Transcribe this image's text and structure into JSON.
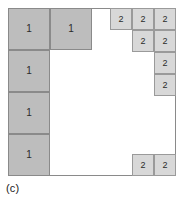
{
  "figure": {
    "caption": "(c)",
    "type": "square-packing-diagram",
    "colors": {
      "tile_1_fill": "#bdbdbd",
      "tile_2_fill": "#d8d8d8",
      "border": "#8a8a8a",
      "background": "#ffffff"
    },
    "container": {
      "x": 8,
      "y": 8,
      "width": 168,
      "height": 168
    },
    "tiles": [
      {
        "label": "1",
        "size_class": "tile-1",
        "x": 0,
        "y": 0,
        "w": 42,
        "h": 42
      },
      {
        "label": "1",
        "size_class": "tile-1",
        "x": 42,
        "y": 0,
        "w": 42,
        "h": 42
      },
      {
        "label": "1",
        "size_class": "tile-1",
        "x": 0,
        "y": 42,
        "w": 42,
        "h": 42
      },
      {
        "label": "1",
        "size_class": "tile-1",
        "x": 0,
        "y": 84,
        "w": 42,
        "h": 42
      },
      {
        "label": "1",
        "size_class": "tile-1",
        "x": 0,
        "y": 126,
        "w": 42,
        "h": 42
      },
      {
        "label": "2",
        "size_class": "tile-2",
        "x": 102,
        "y": 0,
        "w": 22,
        "h": 22
      },
      {
        "label": "2",
        "size_class": "tile-2",
        "x": 124,
        "y": 0,
        "w": 22,
        "h": 22
      },
      {
        "label": "2",
        "size_class": "tile-2",
        "x": 146,
        "y": 0,
        "w": 22,
        "h": 22
      },
      {
        "label": "2",
        "size_class": "tile-2",
        "x": 124,
        "y": 22,
        "w": 22,
        "h": 22
      },
      {
        "label": "2",
        "size_class": "tile-2",
        "x": 146,
        "y": 22,
        "w": 22,
        "h": 22
      },
      {
        "label": "2",
        "size_class": "tile-2",
        "x": 146,
        "y": 44,
        "w": 22,
        "h": 22
      },
      {
        "label": "2",
        "size_class": "tile-2",
        "x": 146,
        "y": 66,
        "w": 22,
        "h": 22
      },
      {
        "label": "2",
        "size_class": "tile-2",
        "x": 124,
        "y": 146,
        "w": 22,
        "h": 22
      },
      {
        "label": "2",
        "size_class": "tile-2",
        "x": 146,
        "y": 146,
        "w": 22,
        "h": 22
      }
    ]
  }
}
